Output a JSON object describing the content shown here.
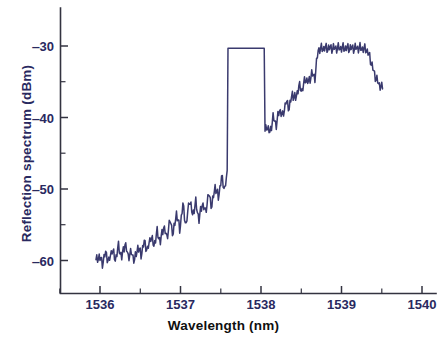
{
  "chart_data": {
    "type": "line",
    "title": "",
    "subtitle": "",
    "xlabel": "Wavelength (nm)",
    "ylabel": "Reflection spectrum (dBm)",
    "xlim": [
      1535.6,
      1540.0
    ],
    "ylim": [
      -64.5,
      -27.5
    ],
    "xticks": [
      1536,
      1537,
      1538,
      1539,
      1540
    ],
    "xtick_labels": [
      "1536",
      "1537",
      "1538",
      "1539",
      "1540"
    ],
    "xminor_ticks": [
      1535.5,
      1536.5,
      1537.5,
      1538.5,
      1539.5
    ],
    "yticks": [
      -30,
      -40,
      -50,
      -60
    ],
    "ytick_labels": [
      "‒30",
      "‒40",
      "‒50",
      "‒60"
    ],
    "yminor_ticks": [
      -35,
      -45,
      -55
    ],
    "grid": false,
    "legend": null,
    "annotations": [],
    "series": [
      {
        "name": "Reflection spectrum",
        "color": "#3a3a6e",
        "linewidth": 1.5,
        "x": [
          1535.95,
          1535.99,
          1536.03,
          1536.07,
          1536.11,
          1536.15,
          1536.19,
          1536.23,
          1536.27,
          1536.31,
          1536.35,
          1536.39,
          1536.43,
          1536.47,
          1536.51,
          1536.55,
          1536.59,
          1536.63,
          1536.67,
          1536.71,
          1536.75,
          1536.79,
          1536.83,
          1536.87,
          1536.91,
          1536.95,
          1536.99,
          1537.03,
          1537.07,
          1537.11,
          1537.15,
          1537.19,
          1537.23,
          1537.27,
          1537.31,
          1537.35,
          1537.39,
          1537.43,
          1537.47,
          1537.51,
          1537.55,
          1537.59,
          1537.63,
          1537.67,
          1537.71,
          1537.75,
          1537.79,
          1537.83,
          1537.87,
          1537.91,
          1537.95,
          1537.99,
          1538.03,
          1538.07,
          1538.11,
          1538.15,
          1538.19,
          1538.23,
          1538.27,
          1538.31,
          1538.35,
          1538.39,
          1538.43,
          1538.47,
          1538.51,
          1538.55,
          1538.59,
          1538.63,
          1538.67,
          1538.71,
          1538.75,
          1538.79,
          1538.83,
          1538.87,
          1538.91,
          1538.95,
          1538.99,
          1539.03,
          1539.07,
          1539.11,
          1539.15,
          1539.19,
          1539.23,
          1539.27,
          1539.31,
          1539.35,
          1539.39,
          1539.43,
          1539.47,
          1539.51
        ],
        "y": [
          -60.1,
          -59.4,
          -60.4,
          -58.9,
          -60.2,
          -58.4,
          -59.9,
          -58.0,
          -59.6,
          -57.6,
          -59.4,
          -58.9,
          -60.0,
          -58.1,
          -59.2,
          -57.4,
          -58.6,
          -56.6,
          -57.9,
          -56.0,
          -57.4,
          -55.2,
          -56.8,
          -54.4,
          -56.3,
          -53.3,
          -55.7,
          -52.2,
          -55.2,
          -51.4,
          -53.6,
          -51.9,
          -54.3,
          -52.0,
          -53.2,
          -50.7,
          -52.4,
          -49.6,
          -51.2,
          -48.4,
          -50.0,
          -47.2,
          -48.9,
          -46.1,
          -47.6,
          -45.0,
          -46.4,
          -44.1,
          -45.4,
          -43.2,
          -44.3,
          -42.3,
          -43.2,
          -41.1,
          -42.2,
          -40.0,
          -41.0,
          -38.9,
          -39.8,
          -37.8,
          -38.6,
          -36.7,
          -37.4,
          -35.6,
          -36.2,
          -34.6,
          -35.1,
          -33.9,
          -34.4,
          -30.5,
          -30.4,
          -30.3,
          -30.3,
          -30.3,
          -30.3,
          -30.3,
          -30.3,
          -30.3,
          -30.3,
          -30.3,
          -30.3,
          -30.3,
          -30.3,
          -30.4,
          -30.5,
          -31.5,
          -33.2,
          -34.6,
          -35.4,
          -36.0
        ]
      }
    ],
    "plateau": {
      "level_dbm": -30.3,
      "start_nm": 1537.58,
      "end_nm": 1538.05
    },
    "noise_floor_dbm": -60
  },
  "axes": {
    "xlabel": "Wavelength (nm)",
    "ylabel": "Reflection spectrum (dBm)",
    "xtick_labels": [
      "1536",
      "1537",
      "1538",
      "1539",
      "1540"
    ],
    "ytick_labels": [
      "‒30",
      "‒40",
      "‒50",
      "‒60"
    ]
  },
  "colors": {
    "trace": "#3a3a6e",
    "axis": "#333340",
    "ylabel_text": "#29295f",
    "xlabel_text": "#101010",
    "background": "#ffffff"
  }
}
